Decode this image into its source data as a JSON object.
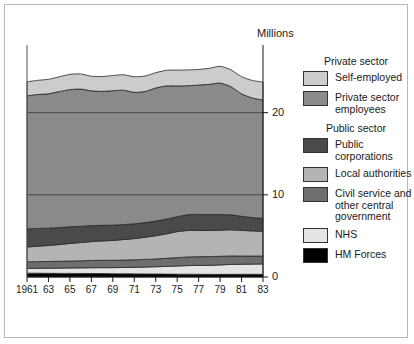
{
  "units_label": "Millions",
  "legend": {
    "groups": [
      {
        "title": "Private sector",
        "items": [
          {
            "label": "Self-employed",
            "color": "#cccccc"
          },
          {
            "label": "Private sector employees",
            "color": "#8a8a8a"
          }
        ]
      },
      {
        "title": "Public  sector",
        "items": [
          {
            "label": "Public corporations",
            "color": "#4a4a4a"
          },
          {
            "label": "Local authorities",
            "color": "#b4b4b4"
          },
          {
            "label": "Civil service and other central government",
            "color": "#6e6e6e"
          },
          {
            "label": "NHS",
            "color": "#e4e4e4"
          },
          {
            "label": "HM Forces",
            "color": "#000000"
          }
        ]
      }
    ]
  },
  "chart_data": {
    "type": "area",
    "title": "",
    "xlabel": "",
    "ylabel": "Millions",
    "ylim": [
      0,
      27.5
    ],
    "yticks": [
      0,
      10,
      20
    ],
    "ytick_labels": [
      "0",
      "10",
      "20"
    ],
    "grid": true,
    "legend_position": "right",
    "x": [
      1961,
      1962,
      1963,
      1964,
      1965,
      1966,
      1967,
      1968,
      1969,
      1970,
      1971,
      1972,
      1973,
      1974,
      1975,
      1976,
      1977,
      1978,
      1979,
      1980,
      1981,
      1982,
      1983
    ],
    "xtick_values": [
      1961,
      1963,
      1965,
      1967,
      1969,
      1971,
      1973,
      1975,
      1977,
      1979,
      1981,
      1983
    ],
    "xtick_labels": [
      "1961",
      "63",
      "65",
      "67",
      "69",
      "71",
      "73",
      "75",
      "77",
      "79",
      "81",
      "83"
    ],
    "stack_order_bottom_to_top": [
      "HM Forces",
      "NHS",
      "Civil service and other central government",
      "Local authorities",
      "Public corporations",
      "Private sector employees",
      "Self-employed"
    ],
    "series": [
      {
        "name": "HM Forces",
        "color": "#000000",
        "values": [
          0.47,
          0.46,
          0.45,
          0.44,
          0.44,
          0.43,
          0.43,
          0.42,
          0.4,
          0.39,
          0.38,
          0.37,
          0.37,
          0.35,
          0.34,
          0.34,
          0.33,
          0.32,
          0.32,
          0.33,
          0.33,
          0.33,
          0.33
        ]
      },
      {
        "name": "NHS",
        "color": "#e4e4e4",
        "values": [
          0.58,
          0.6,
          0.62,
          0.64,
          0.66,
          0.68,
          0.7,
          0.72,
          0.74,
          0.77,
          0.8,
          0.84,
          0.88,
          0.94,
          1.0,
          1.05,
          1.08,
          1.1,
          1.15,
          1.2,
          1.22,
          1.24,
          1.26
        ]
      },
      {
        "name": "Civil service and other central government",
        "color": "#6e6e6e",
        "values": [
          0.8,
          0.81,
          0.82,
          0.83,
          0.84,
          0.86,
          0.88,
          0.89,
          0.89,
          0.9,
          0.91,
          0.93,
          0.95,
          0.98,
          1.02,
          1.05,
          1.06,
          1.06,
          1.05,
          1.03,
          1.0,
          0.98,
          0.96
        ]
      },
      {
        "name": "Local authorities",
        "color": "#b4b4b4",
        "values": [
          1.8,
          1.88,
          1.95,
          2.04,
          2.14,
          2.22,
          2.3,
          2.36,
          2.42,
          2.5,
          2.58,
          2.7,
          2.82,
          2.98,
          3.16,
          3.22,
          3.2,
          3.18,
          3.18,
          3.18,
          3.12,
          3.06,
          3.02
        ]
      },
      {
        "name": "Public corporations",
        "color": "#4a4a4a",
        "values": [
          2.2,
          2.16,
          2.1,
          2.06,
          2.02,
          1.98,
          1.94,
          1.9,
          1.86,
          1.82,
          1.8,
          1.78,
          1.78,
          1.8,
          1.82,
          1.92,
          1.94,
          1.93,
          1.9,
          1.82,
          1.72,
          1.62,
          1.56
        ]
      },
      {
        "name": "Private sector employees",
        "color": "#8a8a8a",
        "values": [
          16.2,
          16.3,
          16.35,
          16.55,
          16.7,
          16.7,
          16.4,
          16.3,
          16.35,
          16.35,
          16.0,
          15.95,
          16.2,
          16.2,
          15.9,
          15.7,
          15.75,
          15.85,
          16.0,
          15.6,
          14.9,
          14.55,
          14.4
        ]
      },
      {
        "name": "Self-employed",
        "color": "#cccccc",
        "values": [
          1.7,
          1.72,
          1.76,
          1.8,
          1.86,
          1.84,
          1.78,
          1.8,
          1.86,
          1.88,
          1.9,
          1.88,
          1.86,
          1.9,
          1.94,
          1.92,
          1.9,
          1.96,
          2.04,
          2.06,
          2.08,
          2.14,
          2.18
        ]
      }
    ]
  }
}
